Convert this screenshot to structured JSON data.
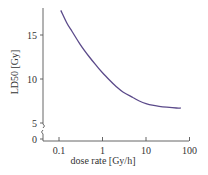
{
  "chart_data": {
    "type": "line",
    "title": "",
    "xlabel": "dose rate [Gy/h]",
    "ylabel": "LD50 [Gy]",
    "xscale": "log",
    "xlim": [
      0.07,
      100
    ],
    "ylim": [
      0,
      18
    ],
    "x_ticks": [
      0.1,
      1,
      10,
      100
    ],
    "x_tick_labels": [
      "0.1",
      "1",
      "10",
      "100"
    ],
    "y_ticks": [
      0,
      5,
      10,
      15
    ],
    "y_tick_labels": [
      "0",
      "5",
      "10",
      "15"
    ],
    "y_axis_break": [
      0.5,
      4.5
    ],
    "grid": false,
    "legend": null,
    "series": [
      {
        "name": "LD50",
        "color": "#5b4a8a",
        "x": [
          0.11,
          0.15,
          0.2,
          0.3,
          0.5,
          0.7,
          1,
          1.5,
          2,
          3,
          5,
          7,
          10,
          15,
          20,
          30,
          50,
          63
        ],
        "y": [
          17.8,
          16.4,
          15.4,
          14.0,
          12.5,
          11.6,
          10.7,
          9.8,
          9.2,
          8.5,
          7.9,
          7.5,
          7.2,
          7.0,
          6.9,
          6.8,
          6.7,
          6.7
        ]
      }
    ]
  }
}
